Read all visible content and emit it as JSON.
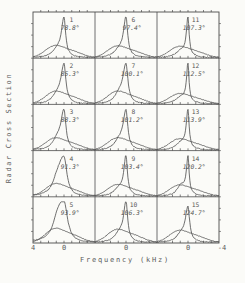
{
  "figure": {
    "ylabel": "Radar Cross Section",
    "xlabel": "Frequency (kHz)"
  },
  "chart_data": {
    "type": "line",
    "layout": "small-multiples-grid",
    "grid": {
      "rows": 5,
      "cols": 3,
      "order": "column-major"
    },
    "title": "",
    "xlabel": "Frequency (kHz)",
    "ylabel": "Radar Cross Section",
    "x_axis": {
      "range": [
        4,
        -4
      ],
      "tick_step_khz": 1,
      "left_label": "4",
      "zero_label": "0",
      "right_label": "-4",
      "note": "axis runs from +4 kHz on the left to -4 kHz on the right; 0 labeled under each column"
    },
    "series_per_panel": [
      "echo spectrum: sharp peak centered at 0 kHz",
      "background clutter spectrum: broad low hump left of 0"
    ],
    "line_color": "#4b4b4b",
    "panels": [
      {
        "num": "1",
        "angle": "78.8°",
        "h": 0.88,
        "w": 0.26,
        "skew": 1.6,
        "sh": 0.05,
        "a2": 0.26
      },
      {
        "num": "2",
        "angle": "85.3°",
        "h": 0.87,
        "w": 0.3,
        "skew": 1.6,
        "sh": 0.08,
        "a2": 0.27
      },
      {
        "num": "3",
        "angle": "88.3°",
        "h": 0.88,
        "w": 0.3,
        "skew": 1.7,
        "sh": 0.1,
        "a2": 0.26
      },
      {
        "num": "4",
        "angle": "91.3°",
        "h": 0.86,
        "w": 0.45,
        "skew": 1.9,
        "sh": 0.16,
        "a2": 0.27
      },
      {
        "num": "5",
        "angle": "93.9°",
        "h": 0.9,
        "w": 0.55,
        "skew": 1.9,
        "sh": 0.18,
        "a2": 0.3
      },
      {
        "num": "6",
        "angle": "97.4°",
        "h": 0.9,
        "w": 0.26,
        "skew": 1.5,
        "sh": 0.06,
        "a2": 0.25
      },
      {
        "num": "7",
        "angle": "100.1°",
        "h": 0.88,
        "w": 0.3,
        "skew": 1.6,
        "sh": 0.1,
        "a2": 0.27
      },
      {
        "num": "8",
        "angle": "101.2°",
        "h": 0.88,
        "w": 0.28,
        "skew": 1.6,
        "sh": 0.09,
        "a2": 0.26
      },
      {
        "num": "9",
        "angle": "103.4°",
        "h": 0.9,
        "w": 0.22,
        "skew": 1.5,
        "sh": 0.07,
        "a2": 0.25
      },
      {
        "num": "10",
        "angle": "106.3°",
        "h": 0.9,
        "w": 0.26,
        "skew": 1.5,
        "sh": 0.08,
        "a2": 0.28
      },
      {
        "num": "11",
        "angle": "107.3°",
        "h": 0.9,
        "w": 0.18,
        "skew": 1.4,
        "sh": 0.05,
        "a2": 0.24
      },
      {
        "num": "12",
        "angle": "112.5°",
        "h": 0.92,
        "w": 0.16,
        "skew": 1.4,
        "sh": 0.04,
        "a2": 0.22
      },
      {
        "num": "13",
        "angle": "113.9°",
        "h": 0.9,
        "w": 0.18,
        "skew": 1.5,
        "sh": 0.06,
        "a2": 0.24
      },
      {
        "num": "14",
        "angle": "120.2°",
        "h": 0.88,
        "w": 0.18,
        "skew": 1.4,
        "sh": 0.14,
        "a2": 0.24
      },
      {
        "num": "15",
        "angle": "124.7°",
        "h": 0.78,
        "w": 0.26,
        "skew": 1.6,
        "sh": 0.08,
        "a2": 0.26
      }
    ]
  }
}
